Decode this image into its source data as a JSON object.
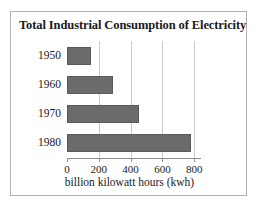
{
  "chart_data": {
    "type": "bar",
    "orientation": "horizontal",
    "title": "Total Industrial Consumption of Electricity",
    "categories": [
      "1950",
      "1960",
      "1970",
      "1980"
    ],
    "values": [
      150,
      290,
      450,
      780
    ],
    "xlabel": "billion kilowatt hours (kwh)",
    "ylabel": "",
    "xlim": [
      0,
      830
    ],
    "xticks": [
      "0",
      "200",
      "400",
      "600",
      "800"
    ],
    "xtick_values": [
      0,
      200,
      400,
      600,
      800
    ],
    "grid": "vertical",
    "legend": "none",
    "series": [
      {
        "name": "Total industrial consumption",
        "values": [
          150,
          290,
          450,
          780
        ]
      }
    ],
    "colors": {
      "bar_fill": "#6b6b6b",
      "bar_edge": "#5a5a5a",
      "gridline": "#c9c9c9",
      "axis": "#8d8d8d",
      "frame": "#b0b0b0",
      "background": "#ffffff",
      "text": "#1a1a1a"
    }
  }
}
